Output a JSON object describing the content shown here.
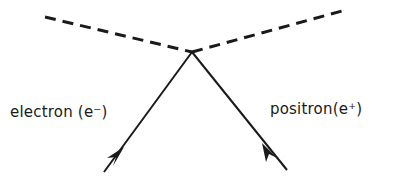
{
  "diagram": {
    "type": "feynman-diagram",
    "stroke_color": "#1a1a1a",
    "vertex": {
      "x": 192,
      "y": 52
    },
    "photon_lines": [
      {
        "name": "left-dashed-line",
        "style": "dashed",
        "from": {
          "x": 45,
          "y": 17
        },
        "to": {
          "x": 192,
          "y": 52
        }
      },
      {
        "name": "right-dashed-line",
        "style": "dashed",
        "from": {
          "x": 192,
          "y": 52
        },
        "to": {
          "x": 342,
          "y": 11
        }
      }
    ],
    "fermion_lines": [
      {
        "name": "electron-line",
        "from": {
          "x": 104,
          "y": 172
        },
        "to": {
          "x": 192,
          "y": 52
        },
        "arrow": "toward-vertex"
      },
      {
        "name": "positron-line",
        "from": {
          "x": 287,
          "y": 170
        },
        "to": {
          "x": 192,
          "y": 52
        },
        "arrow": "toward-vertex"
      }
    ],
    "labels": {
      "electron": "electron (e⁻)",
      "positron": "positron(e⁺)"
    }
  }
}
